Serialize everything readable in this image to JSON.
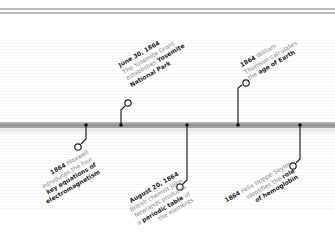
{
  "colors": {
    "bar": "#9a9a9a",
    "connector": "#222222",
    "text_muted": "#8a8a8a",
    "text_bold": "#1e1e1e",
    "top_rule": "#bdbdbd"
  },
  "timeline": {
    "events": [
      {
        "id": "maxwell",
        "side": "below",
        "bar_x": 86,
        "lines": [
          {
            "bold": "1864",
            "text": " Maxwell"
          },
          {
            "bold": "",
            "text": "introduces the four"
          },
          {
            "bold": "key equations of",
            "text": ""
          },
          {
            "bold": "electromagnetism",
            "text": ""
          }
        ]
      },
      {
        "id": "yosemite",
        "side": "above",
        "bar_x": 121,
        "lines": [
          {
            "bold": "June 30, 1864",
            "text": ""
          },
          {
            "bold": "",
            "text": "The Yosemite Grant"
          },
          {
            "bold": "Yosemite",
            "text": "establishes ",
            "bold_last": true
          },
          {
            "bold": "National Park",
            "text": ""
          }
        ]
      },
      {
        "id": "newlands",
        "side": "below",
        "bar_x": 187,
        "lines": [
          {
            "bold": "August 20, 1864",
            "text": ""
          },
          {
            "bold": "",
            "text": "British chemist John"
          },
          {
            "bold": "",
            "text": "Newlands produces"
          },
          {
            "bold": "periodic table",
            "text": "a ",
            "suffix": " of"
          },
          {
            "bold": "",
            "text": "the elements"
          }
        ]
      },
      {
        "id": "thomson",
        "side": "above",
        "bar_x": 238,
        "lines": [
          {
            "bold": "1864",
            "text": " William"
          },
          {
            "bold": "",
            "text": "Thomson calculates"
          },
          {
            "bold": "age of Earth",
            "text": "the "
          }
        ]
      },
      {
        "id": "hoppe-seyler",
        "side": "below",
        "bar_x": 300,
        "lines": [
          {
            "bold": "1864",
            "text": " Felix Hoppe-Seyler"
          },
          {
            "bold": "role",
            "text": "identifies the "
          },
          {
            "bold": "of hemoglobin",
            "text": ""
          }
        ]
      }
    ]
  },
  "labels": {
    "maxwell": {
      "l1_bold": "1864",
      "l1_text": " Maxwell",
      "l2_text": "introduces the four",
      "l3_bold": "key equations of",
      "l4_bold": "electromagnetism"
    },
    "yosemite": {
      "l1_bold": "June 30, 1864",
      "l2_text": "The Yosemite Grant",
      "l3_text": "establishes ",
      "l3_bold": "Yosemite",
      "l4_bold": "National Park"
    },
    "newlands": {
      "l1_bold": "August 20, 1864",
      "l2_text": "British chemist John",
      "l3_text": "Newlands produces",
      "l4_text": "a ",
      "l4_bold": "periodic table",
      "l4_suffix": " of",
      "l5_text": "the elements"
    },
    "thomson": {
      "l1_bold": "1864",
      "l1_text": " William",
      "l2_text": "Thomson calculates",
      "l3_text": "the ",
      "l3_bold": "age of Earth"
    },
    "hoppe": {
      "l1_bold": "1864",
      "l1_text": " Felix Hoppe-Seyler",
      "l2_text": "identifies the ",
      "l2_bold": "role",
      "l3_bold": "of hemoglobin"
    }
  }
}
